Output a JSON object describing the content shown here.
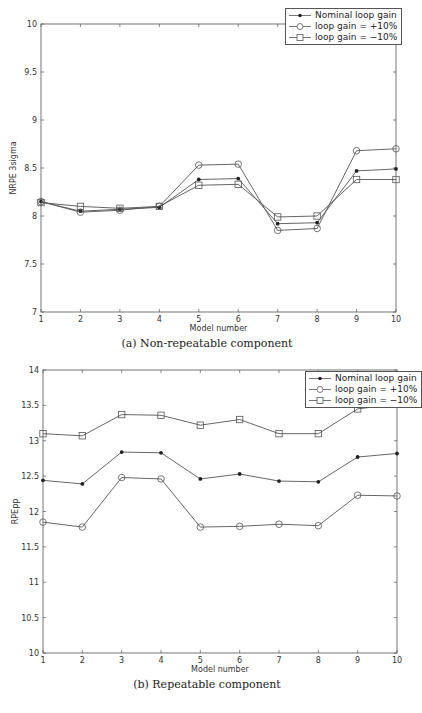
{
  "chart_data": [
    {
      "type": "line",
      "title": "",
      "caption": "(a) Non-repeatable component",
      "xlabel": "Model number",
      "ylabel": "NRPE 3sigma",
      "x": [
        1,
        2,
        3,
        4,
        5,
        6,
        7,
        8,
        9,
        10
      ],
      "xlim": [
        1,
        10
      ],
      "ylim": [
        7,
        10
      ],
      "xticks": [
        "1",
        "2",
        "3",
        "4",
        "5",
        "6",
        "7",
        "8",
        "9",
        "10"
      ],
      "yticks": [
        "7",
        "7.5",
        "8",
        "8.5",
        "9",
        "9.5",
        "10"
      ],
      "grid": false,
      "legend_position": "upper right",
      "series": [
        {
          "name": "Nominal loop gain",
          "marker": "asterisk",
          "values": [
            8.15,
            8.05,
            8.07,
            8.09,
            8.38,
            8.39,
            7.92,
            7.93,
            8.47,
            8.49
          ]
        },
        {
          "name": "loop gain = +10%",
          "marker": "circle",
          "values": [
            8.15,
            8.04,
            8.06,
            8.1,
            8.53,
            8.54,
            7.85,
            7.87,
            8.68,
            8.7
          ]
        },
        {
          "name": "loop gain = −10%",
          "marker": "square",
          "values": [
            8.14,
            8.1,
            8.08,
            8.1,
            8.32,
            8.33,
            7.99,
            8.0,
            8.38,
            8.38
          ]
        }
      ]
    },
    {
      "type": "line",
      "title": "",
      "caption": "(b) Repeatable component",
      "xlabel": "Model number",
      "ylabel": "RPEpp",
      "x": [
        1,
        2,
        3,
        4,
        5,
        6,
        7,
        8,
        9,
        10
      ],
      "xlim": [
        1,
        10
      ],
      "ylim": [
        10,
        14
      ],
      "xticks": [
        "1",
        "2",
        "3",
        "4",
        "5",
        "6",
        "7",
        "8",
        "9",
        "10"
      ],
      "yticks": [
        "10",
        "10.5",
        "11",
        "11.5",
        "12",
        "12.5",
        "13",
        "13.5",
        "14"
      ],
      "grid": false,
      "legend_position": "upper right",
      "series": [
        {
          "name": "Nominal loop gain",
          "marker": "asterisk",
          "values": [
            12.44,
            12.39,
            12.84,
            12.83,
            12.46,
            12.53,
            12.43,
            12.42,
            12.77,
            12.82
          ]
        },
        {
          "name": "loop gain = +10%",
          "marker": "circle",
          "values": [
            11.85,
            11.78,
            12.48,
            12.46,
            11.78,
            11.79,
            11.82,
            11.8,
            12.23,
            12.22
          ]
        },
        {
          "name": "loop gain = −10%",
          "marker": "square",
          "values": [
            13.1,
            13.07,
            13.37,
            13.36,
            13.22,
            13.3,
            13.1,
            13.1,
            13.45,
            13.52
          ]
        }
      ]
    }
  ],
  "figures": [
    {
      "caption": "(a) Non-repeatable component",
      "xlabel": "Model number",
      "ylabel": "NRPE 3sigma",
      "legend": [
        "Nominal loop gain",
        "loop gain = +10%",
        "loop gain = −10%"
      ]
    },
    {
      "caption": "(b) Repeatable component",
      "xlabel": "Model number",
      "ylabel": "RPEpp",
      "legend": [
        "Nominal loop gain",
        "loop gain = +10%",
        "loop gain = −10%"
      ]
    }
  ],
  "colors": {
    "line": "#555555",
    "axis": "#666666",
    "text": "#333333"
  }
}
